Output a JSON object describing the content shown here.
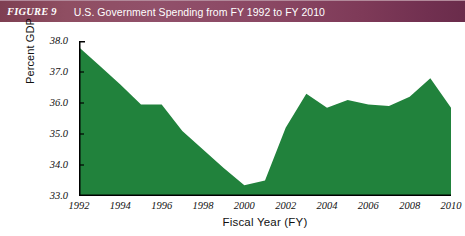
{
  "figure": {
    "label": "FIGURE 9",
    "title": "U.S. Government Spending from FY 1992 to FY 2010"
  },
  "colors": {
    "header_start": "#7e3f52",
    "header_end": "#6a2c4b",
    "area_fill": "#21823c",
    "axis": "#000000",
    "background": "#ffffff",
    "text": "#111111"
  },
  "chart_data": {
    "type": "area",
    "title": "U.S. Government Spending from FY 1992 to FY 2010",
    "xlabel": "Fiscal Year (FY)",
    "ylabel": "Percent GDP",
    "xlim": [
      1992,
      2010
    ],
    "ylim": [
      33.0,
      38.0
    ],
    "grid": false,
    "legend": null,
    "x_tick_labels": [
      "1992",
      "1994",
      "1996",
      "1998",
      "2000",
      "2002",
      "2004",
      "2006",
      "2008",
      "2010"
    ],
    "x_ticks": [
      1992,
      1994,
      1996,
      1998,
      2000,
      2002,
      2004,
      2006,
      2008,
      2010
    ],
    "y_tick_labels": [
      "38.0",
      "37.0",
      "36.0",
      "35.0",
      "34.0",
      "33.0"
    ],
    "y_ticks": [
      38.0,
      37.0,
      36.0,
      35.0,
      34.0,
      33.0
    ],
    "x": [
      1992,
      1993,
      1994,
      1995,
      1996,
      1997,
      1998,
      1999,
      2000,
      2001,
      2002,
      2003,
      2004,
      2005,
      2006,
      2007,
      2008,
      2009,
      2010
    ],
    "values": [
      37.8,
      37.2,
      36.6,
      35.95,
      35.95,
      35.1,
      34.5,
      33.9,
      33.35,
      33.5,
      35.2,
      36.3,
      35.85,
      36.1,
      35.95,
      35.9,
      36.2,
      36.8,
      35.85
    ],
    "series": [
      {
        "name": "Percent GDP",
        "values": [
          37.8,
          37.2,
          36.6,
          35.95,
          35.95,
          35.1,
          34.5,
          33.9,
          33.35,
          33.5,
          35.2,
          36.3,
          35.85,
          36.1,
          35.95,
          35.9,
          36.2,
          36.8,
          35.85
        ]
      }
    ]
  }
}
